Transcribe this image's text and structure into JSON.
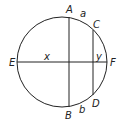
{
  "diagram": {
    "type": "circle-chords",
    "stroke_color": "#222222",
    "circle": {
      "cx": 62,
      "cy": 62,
      "r": 45
    },
    "chords": [
      {
        "name": "AB",
        "x1": 69,
        "y1": 17,
        "x2": 69,
        "y2": 107
      },
      {
        "name": "CD",
        "x1": 93,
        "y1": 30,
        "x2": 93,
        "y2": 95
      },
      {
        "name": "EF",
        "x1": 17,
        "y1": 62,
        "x2": 107,
        "y2": 62
      }
    ],
    "labels": {
      "A": "A",
      "B": "B",
      "C": "C",
      "D": "D",
      "E": "E",
      "F": "F",
      "a": "a",
      "b": "b",
      "x": "x",
      "y": "y"
    }
  }
}
